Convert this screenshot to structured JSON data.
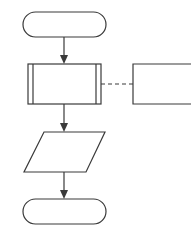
{
  "diagram": {
    "type": "flowchart",
    "stroke_color": "#3a3a3a",
    "background": "#ffffff",
    "nodes": [
      {
        "id": "start",
        "shape": "terminator",
        "label": ""
      },
      {
        "id": "predefined-process",
        "shape": "predefined-process",
        "label": ""
      },
      {
        "id": "annotation",
        "shape": "annotation",
        "label": ""
      },
      {
        "id": "io",
        "shape": "parallelogram",
        "label": ""
      },
      {
        "id": "end",
        "shape": "terminator",
        "label": ""
      }
    ],
    "edges": [
      {
        "from": "start",
        "to": "predefined-process",
        "style": "solid-arrow"
      },
      {
        "from": "predefined-process",
        "to": "annotation",
        "style": "dashed"
      },
      {
        "from": "predefined-process",
        "to": "io",
        "style": "solid-arrow"
      },
      {
        "from": "io",
        "to": "end",
        "style": "solid-arrow"
      }
    ]
  }
}
